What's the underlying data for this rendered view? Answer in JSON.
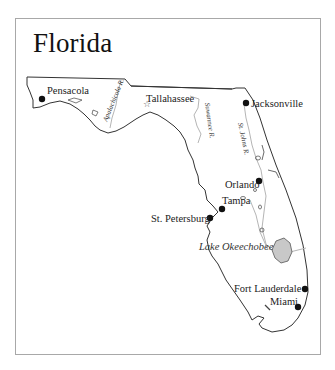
{
  "map": {
    "title": "Florida",
    "cities": [
      {
        "name": "Pensacola",
        "type": "city",
        "x": 42,
        "y": 99,
        "lx": 47,
        "ly": 93
      },
      {
        "name": "Tallahassee",
        "type": "capital",
        "x": 140,
        "y": 103,
        "lx": 147,
        "ly": 101
      },
      {
        "name": "Jacksonville",
        "type": "city",
        "x": 246,
        "y": 103,
        "lx": 253,
        "ly": 106
      },
      {
        "name": "Orlando",
        "type": "city",
        "x": 259,
        "y": 181,
        "lx": 222,
        "ly": 187
      },
      {
        "name": "Tampa",
        "type": "city",
        "x": 222,
        "y": 209,
        "lx": 222,
        "ly": 204
      },
      {
        "name": "St. Petersburg",
        "type": "city",
        "x": 210,
        "y": 218,
        "lx": 150,
        "ly": 221
      },
      {
        "name": "Fort Lauderdale",
        "type": "city",
        "x": 305,
        "y": 289,
        "lx": 234,
        "ly": 291
      },
      {
        "name": "Miami",
        "type": "city",
        "x": 298,
        "y": 307,
        "lx": 270,
        "ly": 304
      }
    ],
    "water": [
      {
        "name": "Lake Okeechobee",
        "x": 198,
        "y": 250
      }
    ],
    "rivers": [
      {
        "name": "Apalachicola R.",
        "x": 110,
        "y": 118
      },
      {
        "name": "Suwannee R.",
        "x": 205,
        "y": 118
      },
      {
        "name": "St. Johns R.",
        "x": 236,
        "y": 128
      }
    ],
    "colors": {
      "outline": "#333333",
      "river": "#b5b5b5",
      "lake_fill": "#c8c8c8",
      "frame": "#a8a8a8",
      "dot": "#111111"
    }
  }
}
